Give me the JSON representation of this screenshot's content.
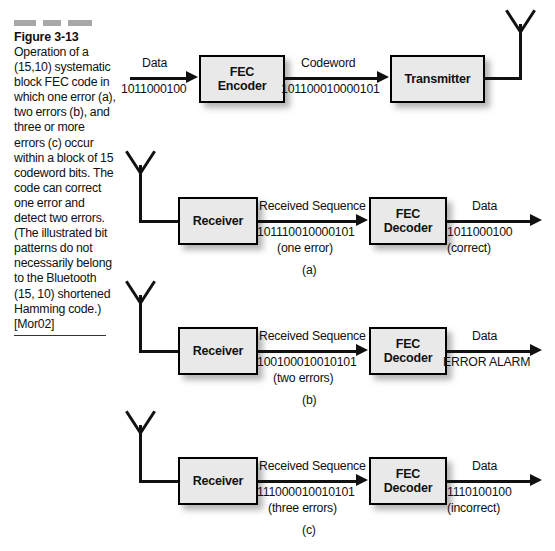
{
  "figure": {
    "number": "Figure 3-13",
    "caption": "Operation of a (15,10) systematic block FEC code in which one error (a), two errors (b), and three or more errors (c) occur within a block of 15 codeword bits. The code can correct one error and detect two errors. (The illustrated bit patterns do not necessarily belong to the Bluetooth (15, 10) shortened Hamming code.) [Mor02]"
  },
  "colors": {
    "box_fill": "#e9e9e9",
    "line": "#111111",
    "dash": "#a8a8a8"
  },
  "transmit_row": {
    "input_label": "Data",
    "input_bits": "1011000100",
    "encoder_label_line1": "FEC",
    "encoder_label_line2": "Encoder",
    "mid_label": "Codeword",
    "mid_bits": "101100010000101",
    "transmitter_label": "Transmitter",
    "antenna_name": "transmit-antenna"
  },
  "rows": [
    {
      "id": "a",
      "sub_label": "(a)",
      "antenna_name": "receive-antenna",
      "receiver_label": "Receiver",
      "mid_label": "Received Sequence",
      "mid_bits": "101110010000101",
      "mid_note": "(one error)",
      "decoder_label_line1": "FEC",
      "decoder_label_line2": "Decoder",
      "out_label": "Data",
      "out_bits": "1011000100",
      "out_note": "(correct)"
    },
    {
      "id": "b",
      "sub_label": "(b)",
      "antenna_name": "receive-antenna",
      "receiver_label": "Receiver",
      "mid_label": "Received Sequence",
      "mid_bits": "100100010010101",
      "mid_note": "(two errors)",
      "decoder_label_line1": "FEC",
      "decoder_label_line2": "Decoder",
      "out_label": "Data",
      "out_bits": "ERROR ALARM",
      "out_note": ""
    },
    {
      "id": "c",
      "sub_label": "(c)",
      "antenna_name": "receive-antenna",
      "receiver_label": "Receiver",
      "mid_label": "Received Sequence",
      "mid_bits": "111000010010101",
      "mid_note": "(three errors)",
      "decoder_label_line1": "FEC",
      "decoder_label_line2": "Decoder",
      "out_label": "Data",
      "out_bits": "1110100100",
      "out_note": "(incorrect)"
    }
  ]
}
